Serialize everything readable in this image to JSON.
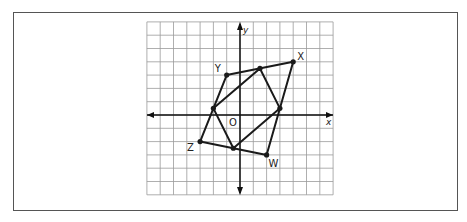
{
  "diagram": {
    "type": "coordinate-plane",
    "axes": {
      "x_label": "x",
      "y_label": "y",
      "origin_label": "O"
    },
    "grid": {
      "x_min": -7,
      "x_max": 7,
      "y_min": -6,
      "y_max": 7
    },
    "outer_quadrilateral": {
      "vertices": [
        {
          "label": "X",
          "x": 4,
          "y": 4
        },
        {
          "label": "Y",
          "x": -1,
          "y": 3
        },
        {
          "label": "Z",
          "x": -3,
          "y": -2
        },
        {
          "label": "W",
          "x": 2,
          "y": -3
        }
      ]
    },
    "inner_quadrilateral": {
      "description": "Midpoints of sides of XYZW",
      "vertices": [
        {
          "x": 1.5,
          "y": 3.5
        },
        {
          "x": -2,
          "y": 0.5
        },
        {
          "x": -0.5,
          "y": -2.5
        },
        {
          "x": 3,
          "y": 0.5
        }
      ]
    },
    "colors": {
      "line": "#1a1a1a",
      "grid": "#9a9a9a",
      "frame": "#555555"
    }
  }
}
